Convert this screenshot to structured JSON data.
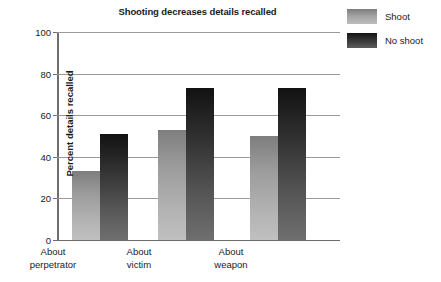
{
  "chart_data": {
    "type": "bar",
    "title": "Shooting decreases details recalled",
    "xlabel": "",
    "ylabel": "Percent details recalled",
    "ylim": [
      0,
      100
    ],
    "yticks": [
      0,
      20,
      40,
      60,
      80,
      100
    ],
    "ytick_labels": [
      "0",
      "20",
      "40",
      "60",
      "80",
      "100"
    ],
    "grid": true,
    "legend_position": "top-right",
    "categories": [
      "About perpetrator",
      "About victim",
      "About weapon"
    ],
    "category_lines": [
      {
        "line1": "About",
        "line2": "perpetrator"
      },
      {
        "line1": "About",
        "line2": "victim"
      },
      {
        "line1": "About",
        "line2": "weapon"
      }
    ],
    "series": [
      {
        "name": "Shoot",
        "color": "#a5a5a5",
        "values": [
          33,
          53,
          50
        ]
      },
      {
        "name": "No shoot",
        "color": "#3b3b3b",
        "values": [
          51,
          73,
          73
        ]
      }
    ]
  },
  "legend": {
    "items": [
      {
        "label": "Shoot",
        "swatch": "light"
      },
      {
        "label": "No shoot",
        "swatch": "dark"
      }
    ]
  }
}
